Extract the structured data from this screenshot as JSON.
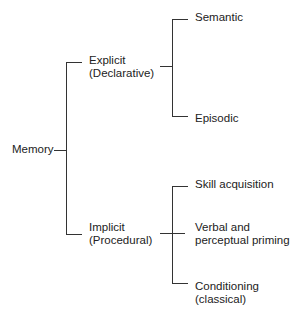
{
  "diagram": {
    "type": "tree",
    "root": {
      "label": "Memory",
      "children": [
        {
          "label_line1": "Explicit",
          "label_line2": "(Declarative)",
          "children": [
            {
              "label": "Semantic"
            },
            {
              "label": "Episodic"
            }
          ]
        },
        {
          "label_line1": "Implicit",
          "label_line2": "(Procedural)",
          "children": [
            {
              "label": "Skill acquisition"
            },
            {
              "label_line1": "Verbal and",
              "label_line2": "perceptual priming"
            },
            {
              "label_line1": "Conditioning",
              "label_line2": "(classical)"
            }
          ]
        }
      ]
    },
    "colors": {
      "line": "#333333",
      "text": "#222222",
      "background": "#ffffff"
    }
  }
}
